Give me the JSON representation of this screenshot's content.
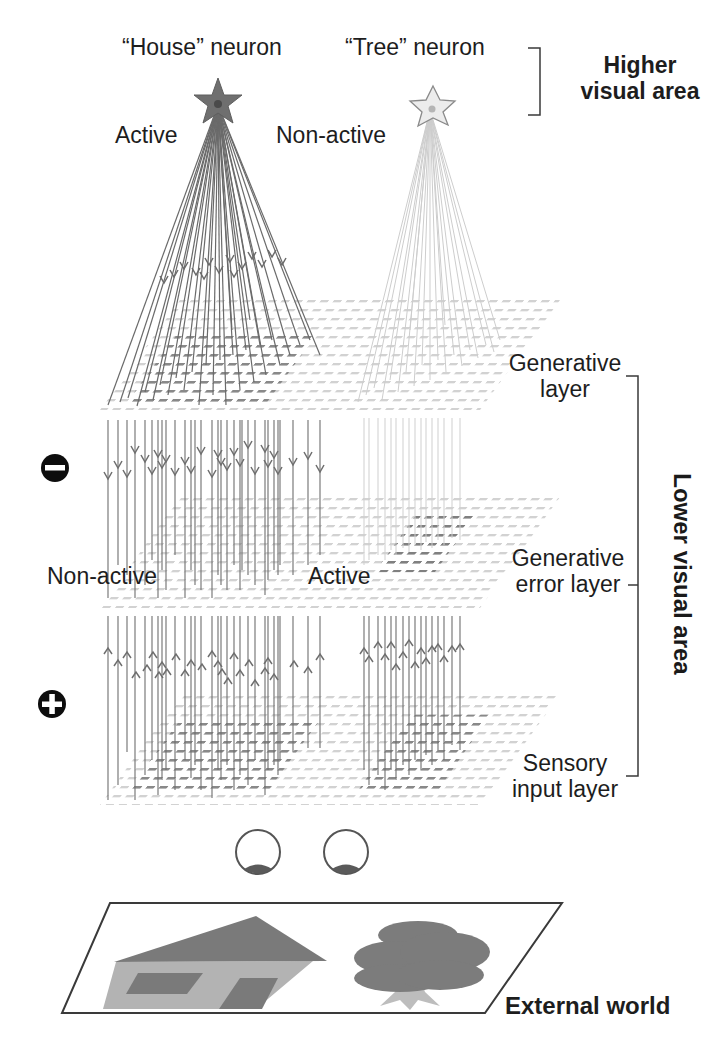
{
  "labels": {
    "house_neuron": "“House” neuron",
    "tree_neuron": "“Tree” neuron",
    "higher_area_line1": "Higher",
    "higher_area_line2": "visual area",
    "house_state": "Active",
    "tree_state": "Non-active",
    "generative_layer_line1": "Generative",
    "generative_layer_line2": "layer",
    "error_layer_line1": "Generative",
    "error_layer_line2": "error layer",
    "error_left_state": "Non-active",
    "error_right_state": "Active",
    "sensory_layer_line1": "Sensory",
    "sensory_layer_line2": "input layer",
    "lower_area": "Lower visual area",
    "external_world": "External world"
  },
  "signs": {
    "minus": "minus-sign-icon",
    "plus": "plus-sign-icon"
  },
  "colors": {
    "active_neuron": "#707070",
    "inactive_neuron": "#e6e6e6",
    "connection_active": "#6e6e6e",
    "connection_inactive": "#c8c8c8",
    "grid_light": "#cfcfcf",
    "grid_dark": "#7a7a7a",
    "house_roof": "#7a7a7a",
    "house_wall": "#b4b4b4",
    "tree_crown": "#7c7c7c",
    "tree_trunk": "#bdbdbd",
    "bracket": "#333333"
  },
  "structure": {
    "layers": [
      "Generative layer",
      "Generative error layer",
      "Sensory input layer"
    ],
    "neurons": [
      {
        "name": "House neuron",
        "state": "Active"
      },
      {
        "name": "Tree neuron",
        "state": "Non-active"
      }
    ],
    "error_layer_states": {
      "left": "Non-active",
      "right": "Active"
    }
  }
}
